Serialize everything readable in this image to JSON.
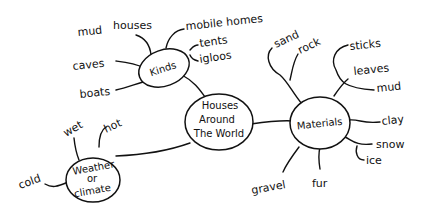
{
  "center": {
    "lines": [
      "Houses",
      "Around",
      "The World"
    ]
  },
  "kinds": {
    "label": "Kinds",
    "leaves": [
      "mud houses",
      "mobile homes",
      "tents",
      "igloos",
      "caves",
      "boats"
    ]
  },
  "materials": {
    "label": "Materials",
    "leaves": [
      "sand",
      "rock",
      "sticks",
      "leaves",
      "mud",
      "clay",
      "snow",
      "ice",
      "gravel",
      "fur"
    ]
  },
  "weather": {
    "lines": [
      "Weather",
      "or",
      "climate"
    ],
    "leaves": [
      "wet",
      "hot",
      "cold"
    ]
  },
  "colors": {
    "ink": "#111111",
    "background": "#ffffff"
  }
}
